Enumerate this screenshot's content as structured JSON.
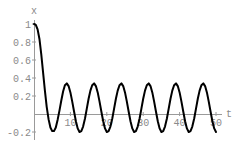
{
  "chart_data": {
    "type": "line",
    "title": "",
    "xlabel": "t",
    "ylabel": "x",
    "xlim": [
      0,
      52
    ],
    "ylim": [
      -0.25,
      1.05
    ],
    "grid": false,
    "legend": null,
    "x_ticks": [
      10,
      20,
      30,
      40,
      50
    ],
    "x_tick_labels": [
      "10",
      "20",
      "30",
      "40",
      "50"
    ],
    "y_ticks": [
      -0.2,
      0.2,
      0.4,
      0.6,
      0.8,
      1
    ],
    "y_tick_labels": [
      "-0.2",
      "0.2",
      "0.4",
      "0.6",
      "0.8",
      "1"
    ],
    "series": [
      {
        "name": "x(t)",
        "color": "#000000",
        "x": [
          0,
          0.5,
          1,
          1.5,
          2,
          2.5,
          3,
          3.5,
          4,
          4.5,
          5,
          5.5,
          6,
          6.5,
          7,
          7.5,
          8,
          8.5,
          9,
          9.5,
          10,
          10.5,
          11,
          11.5,
          12,
          12.5,
          13,
          13.5,
          14,
          14.5,
          15,
          15.5,
          16,
          16.5,
          17,
          17.5,
          18,
          18.5,
          19,
          19.5,
          20,
          20.5,
          21,
          21.5,
          22,
          22.5,
          23,
          23.5,
          24,
          24.5,
          25,
          25.5,
          26,
          26.5,
          27,
          27.5,
          28,
          28.5,
          29,
          29.5,
          30,
          30.5,
          31,
          31.5,
          32,
          32.5,
          33,
          33.5,
          34,
          34.5,
          35,
          35.5,
          36,
          36.5,
          37,
          37.5,
          38,
          38.5,
          39,
          39.5,
          40,
          40.5,
          41,
          41.5,
          42,
          42.5,
          43,
          43.5,
          44,
          44.5,
          45,
          45.5,
          46,
          46.5,
          47,
          47.5,
          48,
          48.5,
          49,
          49.5,
          50
        ],
        "y": [
          1.0,
          0.99,
          0.94,
          0.83,
          0.66,
          0.46,
          0.26,
          0.08,
          -0.06,
          -0.15,
          -0.19,
          -0.19,
          -0.15,
          -0.06,
          0.04,
          0.15,
          0.25,
          0.32,
          0.34,
          0.31,
          0.24,
          0.14,
          0.03,
          -0.08,
          -0.16,
          -0.2,
          -0.19,
          -0.14,
          -0.05,
          0.06,
          0.17,
          0.26,
          0.32,
          0.34,
          0.31,
          0.24,
          0.14,
          0.03,
          -0.08,
          -0.16,
          -0.2,
          -0.19,
          -0.14,
          -0.05,
          0.06,
          0.17,
          0.26,
          0.32,
          0.34,
          0.31,
          0.24,
          0.14,
          0.03,
          -0.08,
          -0.16,
          -0.2,
          -0.19,
          -0.14,
          -0.05,
          0.06,
          0.17,
          0.26,
          0.32,
          0.34,
          0.31,
          0.24,
          0.14,
          0.03,
          -0.08,
          -0.16,
          -0.2,
          -0.19,
          -0.14,
          -0.05,
          0.06,
          0.17,
          0.26,
          0.32,
          0.34,
          0.31,
          0.24,
          0.14,
          0.03,
          -0.08,
          -0.16,
          -0.2,
          -0.19,
          -0.14,
          -0.05,
          0.06,
          0.17,
          0.26,
          0.32,
          0.34,
          0.31,
          0.24,
          0.14,
          0.03,
          -0.08,
          -0.16,
          -0.2
        ]
      }
    ]
  },
  "layout": {
    "origin_px": [
      34,
      114
    ],
    "px_per_x_unit": 3.64,
    "px_per_y_unit": 90,
    "x_axis_end_px": 222,
    "y_axis_top_px": 20,
    "y_axis_bottom_px": 140,
    "axis_color": "#9a9a9a",
    "label_color": "#8a8a8a"
  }
}
